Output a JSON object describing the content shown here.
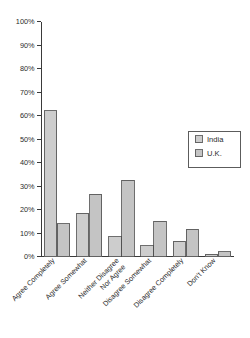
{
  "chart_data": {
    "type": "bar",
    "title": "",
    "subtitle": "",
    "xlabel": "",
    "ylabel": "",
    "ylim": [
      0,
      100
    ],
    "grid": false,
    "legend_position": "right-middle",
    "categories": [
      "Agree Completely",
      "Agree Somewhat",
      "Neither Disagree Nor Agree",
      "Disagree Somewhat",
      "Disagree Completely",
      "Don't Know"
    ],
    "category_lines": [
      [
        "Agree Completely"
      ],
      [
        "Agree Somewhat"
      ],
      [
        "Neither Disagree",
        "Nor Agree"
      ],
      [
        "Disagree Somewhat"
      ],
      [
        "Disagree Completely"
      ],
      [
        "Don't Know"
      ]
    ],
    "ytick_labels": [
      "0%",
      "10%",
      "20%",
      "30%",
      "40%",
      "50%",
      "60%",
      "70%",
      "80%",
      "90%",
      "100%"
    ],
    "ytick_values": [
      0,
      10,
      20,
      30,
      40,
      50,
      60,
      70,
      80,
      90,
      100
    ],
    "series": [
      {
        "name": "India",
        "color": "#cdcdcd",
        "values": [
          62,
          18.5,
          8.5,
          4.5,
          6.5,
          1
        ]
      },
      {
        "name": "U.K.",
        "color": "#c4c4c4",
        "values": [
          14,
          26.5,
          32.5,
          15,
          11.5,
          2
        ]
      }
    ]
  },
  "legend": {
    "entries": [
      {
        "label": "India",
        "swatch_color": "#cdcdcd"
      },
      {
        "label": "U.K.",
        "swatch_color": "#c4c4c4"
      }
    ]
  },
  "colors": {
    "axis": "#3a3a3a",
    "bar_border": "#4a4a4a",
    "background": "#ffffff",
    "text": "#2b2b2b"
  }
}
